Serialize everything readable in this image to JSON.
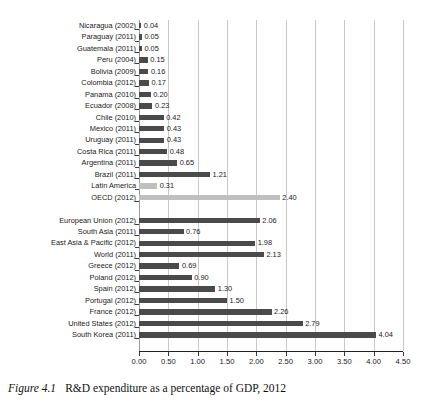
{
  "caption": {
    "number": "Figure 4.1",
    "text": "R&D expenditure as a percentage of GDP, 2012"
  },
  "chart_data": {
    "type": "bar",
    "orientation": "horizontal",
    "title": "R&D expenditure as a percentage of GDP, 2012",
    "xlabel": "",
    "ylabel": "",
    "xlim": [
      0.0,
      4.5
    ],
    "xticks": [
      "0.00",
      "0.50",
      "1.00",
      "1.50",
      "2.00",
      "2.50",
      "3.00",
      "3.50",
      "4.00",
      "4.50"
    ],
    "xtick_values": [
      0.0,
      0.5,
      1.0,
      1.5,
      2.0,
      2.5,
      3.0,
      3.5,
      4.0,
      4.5
    ],
    "grid": "vertical",
    "legend": "none",
    "bar_color_default": "#4a4a4a",
    "bar_color_highlight": "#c0c0c0",
    "categories": [
      "Nicaragua (2002)",
      "Paraguay (2011)",
      "Guatemala (2011)",
      "Peru (2004)",
      "Bolivia (2009)",
      "Colombia (2012)",
      "Panama (2010)",
      "Ecuador (2008)",
      "Chile (2010)",
      "Mexico (2011)",
      "Uruguay (2011)",
      "Costa Rica (2011)",
      "Argentina (2011)",
      "Brazil (2011)",
      "Latin America",
      "OECD (2012)",
      "European Union (2012)",
      "South Asia (2011)",
      "East Asia & Pacific (2012)",
      "World (2011)",
      "Greece (2012)",
      "Poland (2012)",
      "Spain (2012)",
      "Portugal (2012)",
      "France (2012)",
      "United States (2012)",
      "South Korea (2011)"
    ],
    "values": [
      0.04,
      0.05,
      0.05,
      0.15,
      0.16,
      0.17,
      0.2,
      0.23,
      0.42,
      0.43,
      0.43,
      0.48,
      0.65,
      1.21,
      0.31,
      2.4,
      2.06,
      0.76,
      1.98,
      2.13,
      0.69,
      0.9,
      1.3,
      1.5,
      2.26,
      2.79,
      4.04
    ],
    "value_labels": [
      "0.04",
      "0.05",
      "0.05",
      "0.15",
      "0.16",
      "0.17",
      "0.20",
      "0.23",
      "0.42",
      "0.43",
      "0.43",
      "0.48",
      "0.65",
      "1.21",
      "0.31",
      "2.40",
      "2.06",
      "0.76",
      "1.98",
      "2.13",
      "0.69",
      "0.90",
      "1.30",
      "1.50",
      "2.26",
      "2.79",
      "4.04"
    ],
    "highlighted": [
      "Latin America",
      "OECD (2012)"
    ],
    "row_slots": [
      0,
      1,
      2,
      3,
      4,
      5,
      6,
      7,
      8,
      9,
      10,
      11,
      12,
      13,
      14,
      15,
      17,
      18,
      19,
      20,
      21,
      22,
      23,
      24,
      25,
      26,
      27
    ],
    "total_slots": 29
  }
}
